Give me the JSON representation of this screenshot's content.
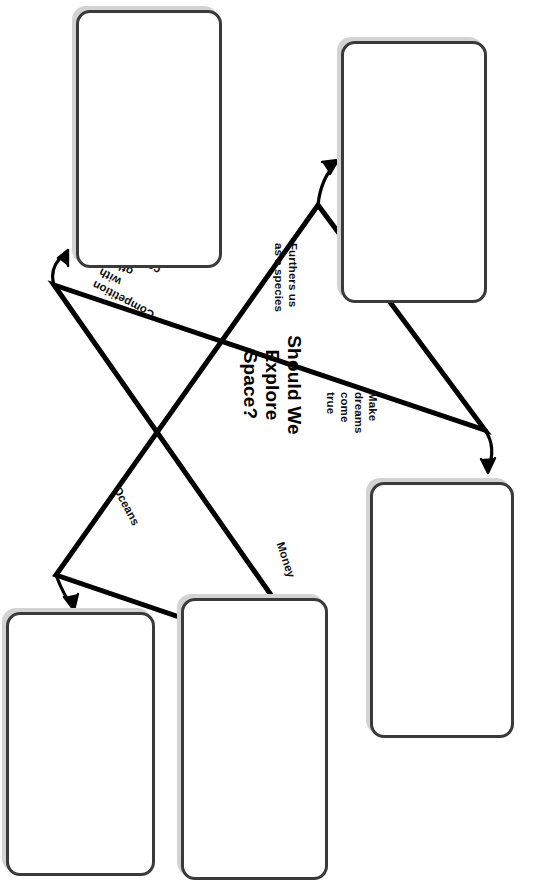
{
  "worksheet": {
    "type": "star-graphic-organizer",
    "orientation_degrees": 90,
    "center_prompt": "Should We\nExplore\nSpace?",
    "center_prompt_lines": [
      "Should We",
      "Explore",
      "Space?"
    ],
    "points": [
      {
        "id": "point-furthers-us",
        "label": "Furthers us\nas a species",
        "label_lines": [
          "Furthers us",
          "as a species"
        ],
        "x": 300,
        "y": 243,
        "rotation": 90,
        "tip": {
          "x": 318,
          "y": 205
        },
        "arrow_to_box": "box-top-right"
      },
      {
        "id": "point-competition",
        "label": "Competition\nwith\nother\ncountries",
        "label_lines": [
          "Competition",
          "with",
          "other",
          "countries"
        ],
        "x": 150,
        "y": 320,
        "rotation": 208,
        "tip": {
          "x": 54,
          "y": 285
        },
        "arrow_to_box": "box-top-left"
      },
      {
        "id": "point-make-dreams",
        "label": "Make\ndreams\ncome\ntrue",
        "label_lines": [
          "Make",
          "dreams",
          "come",
          "true"
        ],
        "x": 380,
        "y": 392,
        "rotation": 90,
        "tip": {
          "x": 485,
          "y": 430
        },
        "arrow_to_box": "box-right"
      },
      {
        "id": "point-oceans",
        "label": "Oceans",
        "label_lines": [
          "Oceans"
        ],
        "x": 123,
        "y": 484,
        "rotation": 62,
        "tip": {
          "x": 56,
          "y": 575
        },
        "arrow_to_box": "box-bottom-left"
      },
      {
        "id": "point-money",
        "label": "Money",
        "label_lines": [
          "Money"
        ],
        "x": 287,
        "y": 540,
        "rotation": 72,
        "tip": {
          "x": 320,
          "y": 665
        },
        "arrow_to_box": "box-bottom-middle"
      }
    ],
    "boxes": [
      {
        "id": "box-top-left",
        "value": "",
        "placeholder": "",
        "x": 76,
        "y": 10,
        "w": 146,
        "h": 258
      },
      {
        "id": "box-top-right",
        "value": "",
        "placeholder": "",
        "x": 341,
        "y": 41,
        "w": 146,
        "h": 262
      },
      {
        "id": "box-right",
        "value": "",
        "placeholder": "",
        "x": 370,
        "y": 482,
        "w": 144,
        "h": 256
      },
      {
        "id": "box-bottom-left",
        "value": "",
        "placeholder": "",
        "x": 6,
        "y": 612,
        "w": 149,
        "h": 264
      },
      {
        "id": "box-bottom-middle",
        "value": "",
        "placeholder": "",
        "x": 181,
        "y": 598,
        "w": 147,
        "h": 282
      }
    ],
    "colors": {
      "star_stroke": "#000000",
      "box_border": "#3a3a3a",
      "box_shadow": "#d3d3d3",
      "page_background": "#ffffff",
      "text": "#111111"
    }
  }
}
